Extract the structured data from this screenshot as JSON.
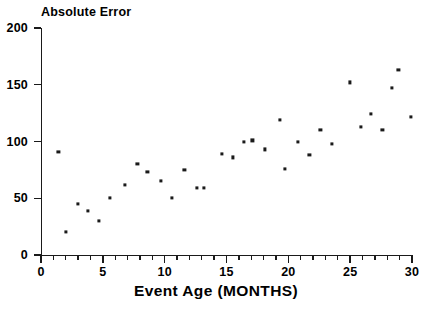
{
  "chart_data": {
    "type": "scatter",
    "title": "",
    "ylabel": "Absolute Error",
    "xlabel": "Event Age (MONTHS)",
    "xlim": [
      0,
      30
    ],
    "ylim": [
      0,
      200
    ],
    "grid": false,
    "legend": null,
    "marker_color": "#1a1a1a",
    "x_tick_labels": [
      "0",
      "5",
      "10",
      "15",
      "20",
      "25",
      "30"
    ],
    "x_tick_values": [
      0,
      5,
      10,
      15,
      20,
      25,
      30
    ],
    "x_minor_tick_interval": 1,
    "y_tick_labels": [
      "0",
      "50",
      "100",
      "150",
      "200"
    ],
    "y_tick_values": [
      0,
      50,
      100,
      150,
      200
    ],
    "points": [
      {
        "x": 1.4,
        "y": 91
      },
      {
        "x": 2.0,
        "y": 20
      },
      {
        "x": 3.0,
        "y": 45
      },
      {
        "x": 3.8,
        "y": 39
      },
      {
        "x": 4.7,
        "y": 30
      },
      {
        "x": 5.6,
        "y": 50
      },
      {
        "x": 6.8,
        "y": 62
      },
      {
        "x": 7.8,
        "y": 80
      },
      {
        "x": 8.6,
        "y": 73
      },
      {
        "x": 9.7,
        "y": 65
      },
      {
        "x": 10.6,
        "y": 50
      },
      {
        "x": 11.6,
        "y": 75
      },
      {
        "x": 12.6,
        "y": 59
      },
      {
        "x": 13.2,
        "y": 59
      },
      {
        "x": 14.6,
        "y": 89
      },
      {
        "x": 15.5,
        "y": 86
      },
      {
        "x": 16.4,
        "y": 100
      },
      {
        "x": 17.1,
        "y": 101
      },
      {
        "x": 18.1,
        "y": 93
      },
      {
        "x": 19.3,
        "y": 119
      },
      {
        "x": 19.7,
        "y": 76
      },
      {
        "x": 20.8,
        "y": 100
      },
      {
        "x": 21.7,
        "y": 88
      },
      {
        "x": 22.6,
        "y": 110
      },
      {
        "x": 23.5,
        "y": 98
      },
      {
        "x": 25.0,
        "y": 152
      },
      {
        "x": 25.9,
        "y": 113
      },
      {
        "x": 26.7,
        "y": 124
      },
      {
        "x": 27.6,
        "y": 110
      },
      {
        "x": 28.4,
        "y": 147
      },
      {
        "x": 28.9,
        "y": 163
      },
      {
        "x": 29.9,
        "y": 122
      }
    ]
  }
}
